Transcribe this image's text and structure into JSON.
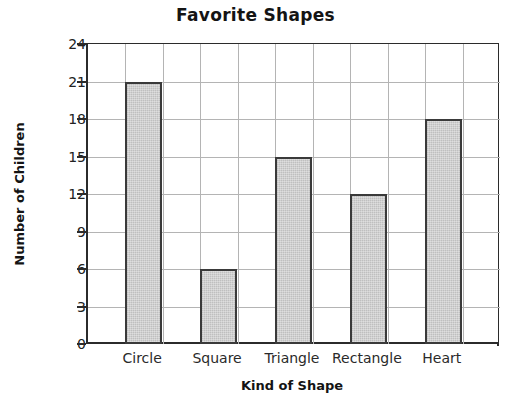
{
  "chart_data": {
    "type": "bar",
    "title": "Favorite Shapes",
    "xlabel": "Kind of Shape",
    "ylabel": "Number of Children",
    "categories": [
      "Circle",
      "Square",
      "Triangle",
      "Rectangle",
      "Heart"
    ],
    "values": [
      21,
      6,
      15,
      12,
      18
    ],
    "ylim": [
      0,
      24
    ],
    "ytick_step": 3,
    "yticks": [
      0,
      3,
      6,
      9,
      12,
      15,
      18,
      21,
      24
    ],
    "grid": true,
    "grid_vertical_columns": 11,
    "legend": null,
    "bar_fill_color": "#c9c9c9",
    "bar_border_color": "#3a3a3a",
    "axis_color": "#2b2b2b",
    "grid_color": "#b4b4b4",
    "background_color": "#ffffff",
    "text_color": "#141414"
  }
}
